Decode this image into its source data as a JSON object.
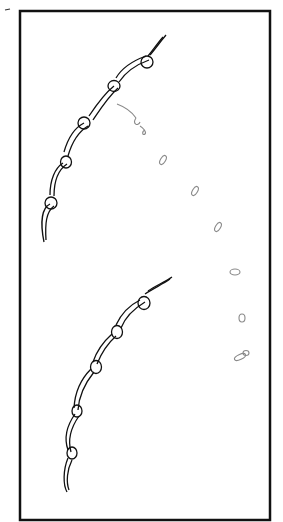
{
  "figure": {
    "frame_color": "#111111",
    "stroke_color": "#111111",
    "guide_color": "#8a8a8a",
    "upper_chain": {
      "loops": 5
    },
    "lower_chain": {
      "loops": 5
    },
    "guide_marks": 7
  }
}
